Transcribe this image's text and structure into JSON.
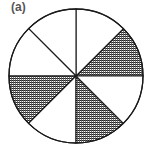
{
  "figure": {
    "label": "(a)",
    "shape": "circle",
    "total_sectors": 8,
    "shaded_sectors": 3,
    "fraction_shaded": "3/8",
    "sectors": [
      {
        "index": 0,
        "from_deg": 0,
        "to_deg": 45,
        "shaded": true
      },
      {
        "index": 1,
        "from_deg": 45,
        "to_deg": 90,
        "shaded": false
      },
      {
        "index": 2,
        "from_deg": 90,
        "to_deg": 135,
        "shaded": false
      },
      {
        "index": 3,
        "from_deg": 135,
        "to_deg": 180,
        "shaded": false
      },
      {
        "index": 4,
        "from_deg": 180,
        "to_deg": 225,
        "shaded": true
      },
      {
        "index": 5,
        "from_deg": 225,
        "to_deg": 270,
        "shaded": false
      },
      {
        "index": 6,
        "from_deg": 270,
        "to_deg": 315,
        "shaded": true
      },
      {
        "index": 7,
        "from_deg": 315,
        "to_deg": 360,
        "shaded": false
      }
    ],
    "colors": {
      "stroke": "#1a1a1a",
      "hatch": "#222222",
      "background": "#ffffff"
    }
  }
}
